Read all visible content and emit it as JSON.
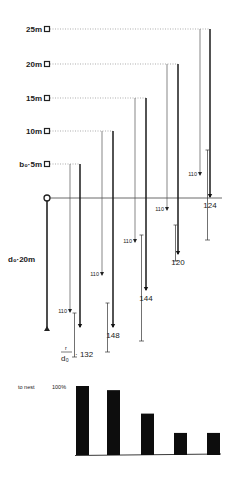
{
  "diagram": {
    "origin": {
      "x": 47,
      "y": 198
    },
    "baseline_y": 198,
    "dest_label": "d₀·20m",
    "release_markers": [
      {
        "label": "25m",
        "y": 29,
        "thin_x": 200,
        "thick_x": 210
      },
      {
        "label": "20m",
        "y": 64,
        "thin_x": 167,
        "thick_x": 178
      },
      {
        "label": "15m",
        "y": 98,
        "thin_x": 135,
        "thick_x": 146
      },
      {
        "label": "10m",
        "y": 131,
        "thin_x": 102,
        "thick_x": 113
      },
      {
        "label": "b₀·5m",
        "y": 164,
        "thin_x": 70,
        "thick_x": 80
      }
    ],
    "predicted_label": "110",
    "ratio_label_prefix": "r/d₀",
    "traces": [
      {
        "id": "5m",
        "thin_x": 70,
        "thin_end": 312,
        "pred_label": "110",
        "thick_x": 80,
        "thick_end": 327,
        "range_x": 77,
        "range_top": 313,
        "range_bottom": 357,
        "value": "132"
      },
      {
        "id": "10m",
        "thin_x": 102,
        "thin_end": 275,
        "pred_label": "110",
        "thick_x": 113,
        "thick_end": 327,
        "range_x": 110,
        "range_top": 303,
        "range_bottom": 352,
        "value": "148"
      },
      {
        "id": "15m",
        "thin_x": 135,
        "thin_end": 242,
        "pred_label": "110",
        "thick_x": 146,
        "thick_end": 290,
        "range_x": 144,
        "range_top": 235,
        "range_bottom": 341,
        "value": "144"
      },
      {
        "id": "20m",
        "thin_x": 167,
        "thin_end": 210,
        "pred_label": "110",
        "thick_x": 178,
        "thick_end": 254,
        "range_x": 178,
        "range_top": 225,
        "range_bottom": 261,
        "value": "120"
      },
      {
        "id": "25m",
        "thin_x": 200,
        "thin_end": 175,
        "pred_label": "110",
        "thick_x": 210,
        "thick_end": 197,
        "range_x": 210,
        "range_top": 150,
        "range_bottom": 240,
        "value": "124"
      }
    ]
  },
  "bar_chart": {
    "ylabel": "to nest",
    "ymax_label": "100%"
  },
  "chart_data": {
    "type": "bar",
    "title": "",
    "ylabel": "to nest",
    "ymax_label": "100%",
    "categories": [
      "5m",
      "10m",
      "15m",
      "20m",
      "25m"
    ],
    "values": [
      100,
      94,
      60,
      32,
      32
    ],
    "ylim": [
      0,
      100
    ]
  }
}
